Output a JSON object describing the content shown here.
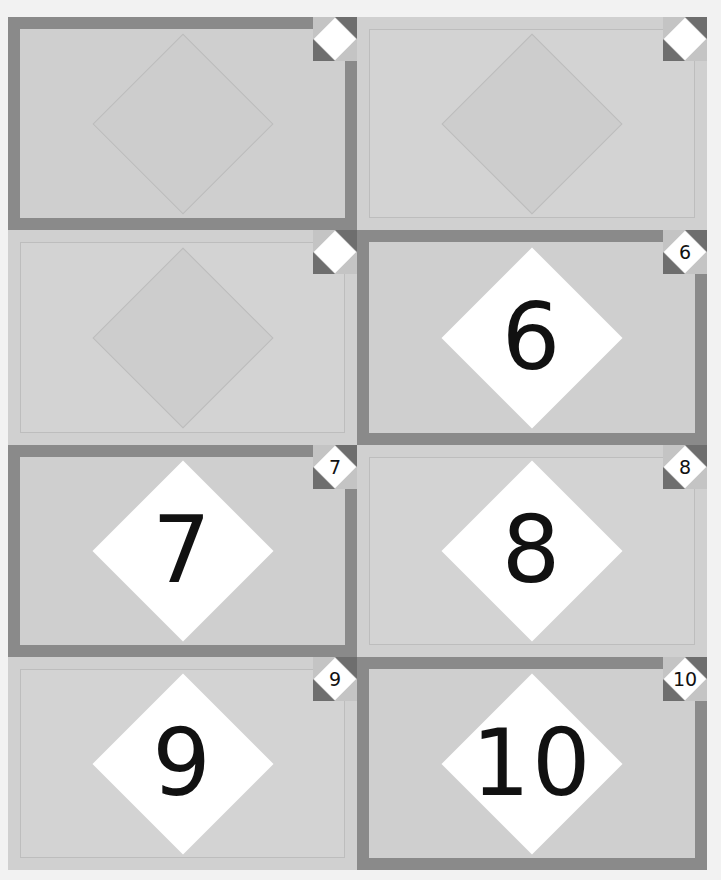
{
  "game": {
    "type": "memory-card-grid",
    "columns": 2,
    "rows": 4,
    "colors": {
      "background": "#f2f2f2",
      "cell_fill": "#d3d3d3",
      "frame": "#8a8a8a",
      "badge_triangle": "#6e6e6e",
      "diamond_revealed": "#ffffff",
      "number": "#111111"
    }
  },
  "cards": [
    {
      "position": "row1-col1",
      "framed": true,
      "revealed": false,
      "number": "",
      "badge_number": ""
    },
    {
      "position": "row1-col2",
      "framed": false,
      "revealed": false,
      "number": "",
      "badge_number": ""
    },
    {
      "position": "row2-col1",
      "framed": false,
      "revealed": false,
      "number": "",
      "badge_number": ""
    },
    {
      "position": "row2-col2",
      "framed": true,
      "revealed": true,
      "number": "6",
      "badge_number": "6"
    },
    {
      "position": "row3-col1",
      "framed": true,
      "revealed": true,
      "number": "7",
      "badge_number": "7"
    },
    {
      "position": "row3-col2",
      "framed": false,
      "revealed": true,
      "number": "8",
      "badge_number": "8"
    },
    {
      "position": "row4-col1",
      "framed": false,
      "revealed": true,
      "number": "9",
      "badge_number": "9"
    },
    {
      "position": "row4-col2",
      "framed": true,
      "revealed": true,
      "number": "10",
      "badge_number": "10"
    }
  ]
}
